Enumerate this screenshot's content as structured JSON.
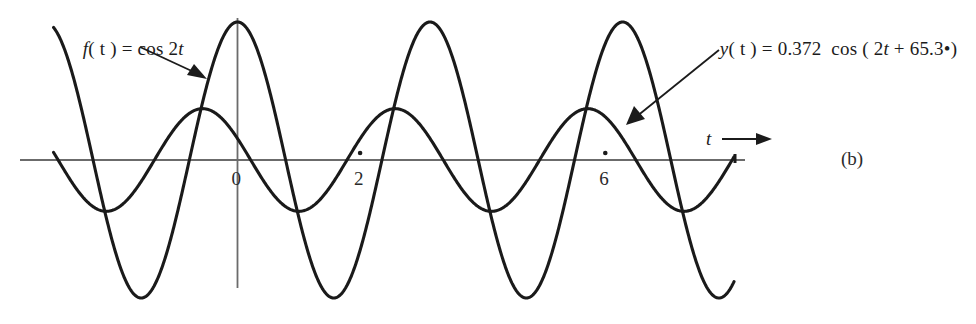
{
  "figure": {
    "caption": "(b)",
    "background_color": "#ffffff",
    "curve_color": "#1a1a1a",
    "axis_color": "#6b6b6b",
    "text_color": "#1b1b1b"
  },
  "labels": {
    "f_label_lead": "f",
    "f_label_rest": "( t ) = cos 2",
    "f_label_var": "t",
    "f_label_full": "f ( t ) = cos 2t",
    "y_label_lead": "y",
    "y_label_mid": "( t ) = 0.372  cos ( 2",
    "y_label_var": "t",
    "y_label_tail": " + 65.3",
    "y_label_degree": "•",
    "y_label_close": ")",
    "y_label_full": "y ( t ) = 0.372  cos ( 2t + 65.3•)",
    "axis_variable": "t"
  },
  "axis": {
    "ticks": [
      {
        "label": "0",
        "t": 0
      },
      {
        "label": "2",
        "t": 2
      },
      {
        "label": "6",
        "t": 6
      }
    ],
    "t_min": -3.0,
    "t_max": 8.1,
    "arrow_direction": "right"
  },
  "chart_data": {
    "type": "line",
    "title": "",
    "subtitle": "",
    "xlabel": "t",
    "ylabel": "",
    "xlim": [
      -3.0,
      8.1
    ],
    "ylim": [
      -1.08,
      1.08
    ],
    "grid": false,
    "legend": "annotations",
    "xticks": [
      0,
      2,
      6
    ],
    "xticklabels": [
      "0",
      "2",
      "6"
    ],
    "yticks": [],
    "yticklabels": [],
    "annotations": [
      {
        "text": "f ( t ) = cos 2t",
        "target_t": -0.72,
        "target_value": 0.62,
        "arrow": true
      },
      {
        "text": "y ( t ) = 0.372  cos ( 2t + 65.3•)",
        "target_t": 6.35,
        "target_value": 0.28,
        "arrow": true
      }
    ],
    "series": [
      {
        "name": "f ( t ) = cos 2t",
        "expression": "cos(2t)",
        "amplitude": 1.0,
        "angular_frequency": 2,
        "phase_deg": 0,
        "period": 3.14159,
        "color": "#1a1a1a",
        "linewidth": 3.1,
        "x": [
          -3.0,
          -2.75,
          -2.5,
          -2.25,
          -2.0,
          -1.75,
          -1.5,
          -1.25,
          -1.0,
          -0.75,
          -0.5,
          -0.25,
          0.0,
          0.25,
          0.5,
          0.75,
          1.0,
          1.25,
          1.5,
          1.75,
          2.0,
          2.25,
          2.5,
          2.75,
          3.0,
          3.25,
          3.5,
          3.75,
          4.0,
          4.25,
          4.5,
          4.75,
          5.0,
          5.25,
          5.5,
          5.75,
          6.0,
          6.25,
          6.5,
          6.75,
          7.0,
          7.25,
          7.5,
          7.75,
          8.1
        ],
        "values": [
          0.96,
          0.71,
          0.28,
          -0.21,
          -0.65,
          -0.94,
          -1.0,
          -0.8,
          -0.42,
          0.07,
          0.54,
          0.88,
          1.0,
          0.88,
          0.54,
          0.07,
          -0.42,
          -0.8,
          -1.0,
          -0.94,
          -0.65,
          -0.21,
          0.28,
          0.71,
          0.96,
          0.99,
          0.78,
          0.37,
          -0.15,
          -0.6,
          -0.91,
          -1.0,
          -0.84,
          -0.48,
          0.01,
          0.49,
          0.84,
          0.99,
          0.91,
          0.6,
          0.15,
          -0.37,
          -0.78,
          -0.99,
          -0.77
        ]
      },
      {
        "name": "y ( t ) = 0.372  cos ( 2t + 65.3•)",
        "expression": "0.372 cos(2t + 65.3 deg)",
        "amplitude": 0.372,
        "angular_frequency": 2,
        "phase_deg": 65.3,
        "period": 3.14159,
        "color": "#1a1a1a",
        "linewidth": 3.1,
        "x": [
          -3.0,
          -2.75,
          -2.5,
          -2.25,
          -2.0,
          -1.75,
          -1.5,
          -1.25,
          -1.0,
          -0.75,
          -0.5,
          -0.25,
          0.0,
          0.25,
          0.5,
          0.75,
          1.0,
          1.25,
          1.5,
          1.75,
          2.0,
          2.25,
          2.5,
          2.75,
          3.0,
          3.25,
          3.5,
          3.75,
          4.0,
          4.25,
          4.5,
          4.75,
          5.0,
          5.25,
          5.5,
          5.75,
          6.0,
          6.25,
          6.5,
          6.75,
          7.0,
          7.25,
          7.5,
          7.75,
          8.1
        ],
        "values": [
          0.04,
          0.22,
          0.33,
          0.37,
          0.31,
          0.18,
          -0.01,
          -0.19,
          -0.32,
          -0.37,
          -0.34,
          -0.24,
          -0.16,
          0.02,
          0.2,
          0.32,
          0.37,
          0.33,
          0.2,
          0.03,
          -0.16,
          -0.3,
          -0.37,
          -0.35,
          -0.25,
          -0.09,
          0.1,
          0.26,
          0.36,
          0.37,
          0.29,
          0.14,
          -0.05,
          -0.23,
          -0.34,
          -0.37,
          -0.31,
          -0.18,
          0.0,
          0.19,
          0.32,
          0.37,
          0.33,
          0.21,
          -0.04
        ]
      }
    ]
  }
}
